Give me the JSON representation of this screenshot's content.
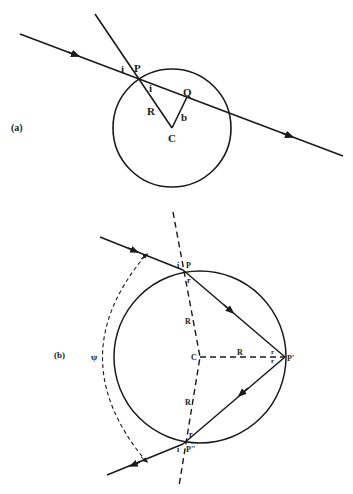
{
  "figure_a": {
    "panel_label": "(a)",
    "points": {
      "P": "P",
      "Q": "Q",
      "C": "C"
    },
    "angle_labels": {
      "i_outer": "i",
      "i_inner": "i"
    },
    "segment_labels": {
      "R": "R",
      "b": "b"
    }
  },
  "figure_b": {
    "panel_label": "(b)",
    "points": {
      "P": "P",
      "P_prime": "P'",
      "P_double_prime": "P''",
      "C": "C"
    },
    "angle_labels": {
      "i_top": "i",
      "r_top": "r",
      "r_right_top": "r",
      "r_right_bottom": "r",
      "r_bottom": "r",
      "i_bottom": "i",
      "psi": "ψ"
    },
    "segment_labels": {
      "R_upper": "R",
      "R_horizontal": "R",
      "R_lower": "R"
    }
  },
  "colors": {
    "line": "#1a1a1a",
    "background": "#ffffff"
  }
}
